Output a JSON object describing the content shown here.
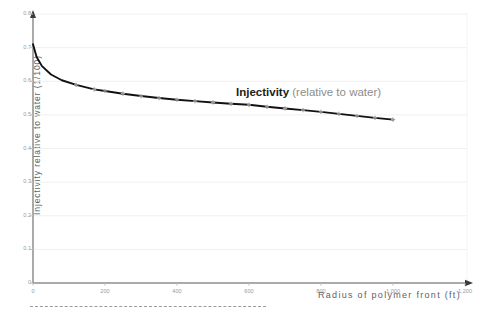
{
  "chart_data": {
    "type": "line",
    "title": "",
    "xlabel": "Radius of polymer front (ft)",
    "ylabel": "Injectivity relative to water (1/100)",
    "xlim": [
      0,
      1200
    ],
    "ylim": [
      0,
      0.8
    ],
    "grid": true,
    "legend": "none",
    "annotations": [
      {
        "text_bold": "Injectivity",
        "text_light": "(relative to water)",
        "x": 560,
        "y": 0.575
      }
    ],
    "xticks": [
      "0",
      "200",
      "400",
      "600",
      "800",
      "1,000",
      "1,200"
    ],
    "xtick_values": [
      0,
      200,
      400,
      600,
      800,
      1000,
      1200
    ],
    "yticks": [
      "0",
      "0.1",
      "0.2",
      "0.3",
      "0.4",
      "0.5",
      "0.6",
      "0.7",
      "0.8"
    ],
    "ytick_values": [
      0,
      0.1,
      0.2,
      0.3,
      0.4,
      0.5,
      0.6,
      0.7,
      0.8
    ],
    "series": [
      {
        "name": "Injectivity (relative to water)",
        "color": "#111111",
        "marker": "cross",
        "marker_color": "#9d9d9d",
        "x": [
          0,
          10,
          25,
          50,
          80,
          120,
          170,
          200,
          250,
          300,
          350,
          400,
          450,
          500,
          550,
          600,
          650,
          700,
          750,
          800,
          850,
          900,
          950,
          1000
        ],
        "values": [
          0.71,
          0.672,
          0.645,
          0.62,
          0.603,
          0.589,
          0.576,
          0.571,
          0.563,
          0.556,
          0.55,
          0.545,
          0.541,
          0.537,
          0.533,
          0.53,
          0.524,
          0.519,
          0.514,
          0.509,
          0.503,
          0.497,
          0.491,
          0.486
        ]
      }
    ]
  },
  "figure": {
    "footer_rule": "dashed-separator"
  }
}
